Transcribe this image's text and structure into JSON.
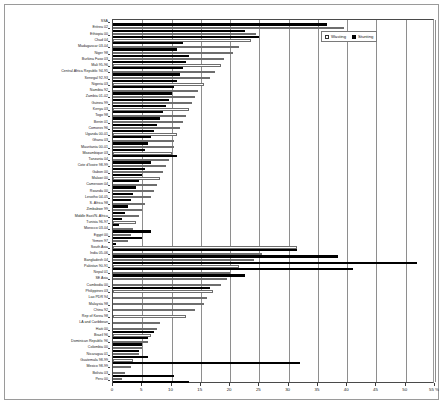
{
  "legend": {
    "position": "top-right",
    "items": [
      {
        "label": "Wasting",
        "swatch": "hollow-square",
        "color": "#ffffff"
      },
      {
        "label": "Stunting",
        "swatch": "filled-square",
        "color": "#000000"
      }
    ]
  },
  "axis": {
    "x_ticks": [
      "0",
      "5",
      "10",
      "15",
      "20",
      "25",
      "30",
      "35",
      "40",
      "45",
      "50",
      "55 %"
    ],
    "x_min": 0,
    "x_max": 55,
    "unit": "%"
  },
  "chart_data": {
    "type": "bar",
    "orientation": "horizontal",
    "title": "",
    "subtitle": "",
    "xlabel": "",
    "ylabel": "",
    "xlim": [
      0,
      55
    ],
    "grid": true,
    "legend_position": "top-right",
    "series": [
      {
        "name": "Wasting",
        "color": "#ffffff"
      },
      {
        "name": "Stunting",
        "color": "#000000"
      }
    ],
    "categories": [
      "SSA",
      "Eritrea 02",
      "Ethiopia 00",
      "Chad 04",
      "Madagascar 03-04",
      "Niger 98",
      "Burkina Faso 03",
      "Mali 95-96",
      "Central Africa Republic 94-95",
      "Senegal 92-93",
      "Nigeria 03",
      "Namibia 92",
      "Zambia 01-02",
      "Guinea 99",
      "Kenya 03",
      "Togo 98",
      "Benin 01",
      "Comoros 96",
      "Uganda 00-01",
      "Ghana 03",
      "Mauritania 00-01",
      "Mozambique 03",
      "Tanzania 04",
      "Cote d'Ivoire 98-99",
      "Gabon 00",
      "Malawi 00",
      "Cameroon 04",
      "Rwanda 00",
      "Lesotho 04-05",
      "S. Africa 98",
      "Zimbabwe 99",
      "Middle East/N. Africa",
      "Tunisia 96-97",
      "Morocco 03-04",
      "Egypt 00",
      "Yemen 97",
      "South Asia",
      "India 05-06",
      "Bangladesh 04",
      "Pakistan 90-91",
      "Nepal 01",
      "SE Asia",
      "Cambodia 00",
      "Philippines 03",
      "Lao PDR 94",
      "Malaysia 98",
      "China 92",
      "Rep of Korea 98",
      "LA and Caribbean",
      "Haiti 00",
      "Brazil 96",
      "Dominican Republic 96",
      "Colombia 00",
      "Nicaragua 01",
      "Guatemala 98-99",
      "Mexico 98-99",
      "Bolivia 03",
      "Peru 00"
    ],
    "values": {
      "Wasting": [
        0.0,
        39.5,
        24.5,
        23.5,
        21.5,
        20.5,
        19.0,
        18.5,
        17.5,
        16.5,
        15.5,
        14.5,
        14.0,
        13.5,
        13.0,
        12.5,
        12.0,
        11.5,
        11.0,
        10.5,
        10.5,
        10.0,
        9.5,
        9.0,
        8.5,
        8.0,
        7.5,
        7.0,
        6.5,
        5.5,
        5.0,
        4.5,
        4.0,
        3.5,
        3.0,
        2.5,
        31.5,
        25.5,
        24.0,
        21.5,
        20.0,
        19.5,
        18.5,
        17.0,
        16.0,
        15.5,
        14.0,
        12.5,
        8.0,
        7.5,
        6.5,
        6.0,
        5.0,
        4.5,
        3.5,
        3.0,
        2.0,
        1.5
      ],
      "Stunting": [
        36.5,
        22.5,
        25.0,
        12.0,
        11.0,
        13.0,
        12.5,
        12.0,
        11.5,
        11.0,
        10.5,
        10.0,
        9.5,
        9.0,
        8.5,
        8.0,
        7.5,
        7.0,
        6.5,
        6.0,
        5.5,
        11.0,
        6.5,
        5.5,
        5.0,
        4.5,
        4.0,
        3.5,
        3.0,
        2.5,
        2.0,
        1.5,
        1.0,
        6.5,
        5.0,
        0.5,
        31.5,
        38.5,
        52.0,
        41.0,
        22.5,
        0.0,
        16.5,
        0.0,
        0.0,
        0.0,
        0.0,
        0.0,
        0.0,
        7.0,
        6.0,
        5.0,
        4.5,
        6.0,
        32.0,
        0.0,
        10.5,
        13.0
      ]
    }
  }
}
